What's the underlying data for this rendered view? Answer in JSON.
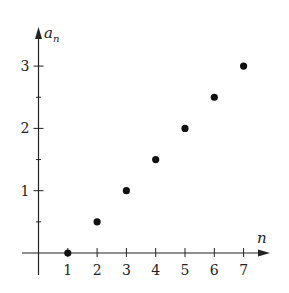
{
  "chart_data": {
    "type": "scatter",
    "title": "",
    "xlabel": "n",
    "ylabel": "a_n",
    "x": [
      1,
      2,
      3,
      4,
      5,
      6,
      7
    ],
    "series": [
      {
        "name": "a_n",
        "values": [
          0,
          0.5,
          1.0,
          1.5,
          2.0,
          2.5,
          3.0
        ]
      }
    ],
    "x_ticks": [
      1,
      2,
      3,
      4,
      5,
      6,
      7
    ],
    "y_ticks": [
      1,
      2,
      3
    ],
    "y_minor_ticks": [
      0.5,
      1.5,
      2.5
    ],
    "xlim": [
      -0.1,
      7.4
    ],
    "ylim": [
      0,
      3.4
    ],
    "grid": false,
    "legend": "none"
  },
  "axes": {
    "x_label": "n",
    "y_label_main": "a",
    "y_label_sub": "n"
  },
  "style": {
    "axis_color": "#222222",
    "point_color": "#111111",
    "background": "#ffffff"
  }
}
